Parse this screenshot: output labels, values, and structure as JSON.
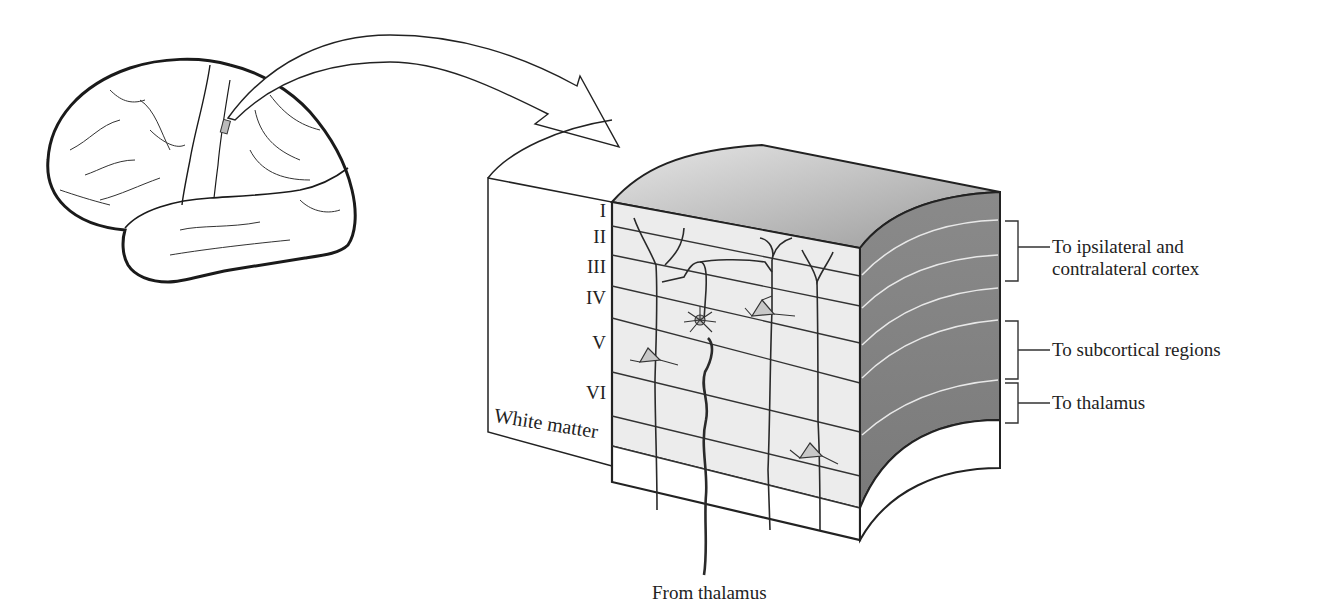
{
  "figure": {
    "layers": [
      {
        "label": "I"
      },
      {
        "label": "II"
      },
      {
        "label": "III"
      },
      {
        "label": "IV"
      },
      {
        "label": "V"
      },
      {
        "label": "VI"
      },
      {
        "label": "White matter"
      }
    ],
    "outputs": [
      {
        "label_line1": "To ipsilateral and",
        "label_line2": "contralateral cortex",
        "layers": "II–III"
      },
      {
        "label_line1": "To subcortical regions",
        "layers": "V"
      },
      {
        "label_line1": "To thalamus",
        "layers": "VI"
      }
    ],
    "input_label": "From thalamus",
    "colors": {
      "top_face": "#d4d4d4",
      "side_face": "#8e8e8e",
      "front_face": "#ececec",
      "line": "#2a2a2a"
    }
  }
}
